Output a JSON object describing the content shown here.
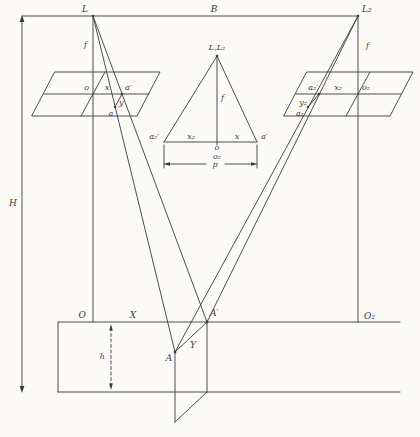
{
  "colors": {
    "paper": "#fbfaf6",
    "ink": "#3b3b3b"
  },
  "labels": {
    "station_left": "L",
    "station_right": "L₂",
    "air_base": "B",
    "flying_height": "H",
    "focal_length_left": "f",
    "focal_length_right": "f",
    "left_photo": {
      "principal_point": "o",
      "x_coord": "x",
      "a_prime": "a′",
      "y_coord": "y",
      "image_point": "a"
    },
    "right_photo": {
      "a2_prime": "a₂′",
      "x2_coord": "x₂",
      "principal_point": "o₂",
      "y2_coord": "y₂",
      "image_point": "a₂"
    },
    "overlay": {
      "apex": "L,L₂",
      "focal": "f",
      "a2_prime": "a₂′",
      "x2": "x₂",
      "o": "o",
      "o2": "o₂",
      "x": "x",
      "a_prime": "a′",
      "parallax": "p"
    },
    "ground": {
      "origin_left": "O",
      "x_axis": "X",
      "a_vertical": "A′",
      "origin_right": "O₂",
      "elevation": "h",
      "point": "A",
      "y_offset": "Y"
    }
  }
}
